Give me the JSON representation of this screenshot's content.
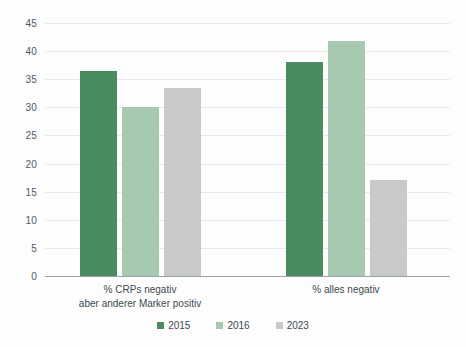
{
  "chart_data": {
    "type": "bar",
    "title": "",
    "subtitle": "",
    "xlabel": "",
    "ylabel": "",
    "ylim": [
      0,
      45
    ],
    "yticks": [
      0,
      5,
      10,
      15,
      20,
      25,
      30,
      35,
      40,
      45
    ],
    "ytick_labels": [
      "0",
      "5",
      "10",
      "15",
      "20",
      "25",
      "30",
      "35",
      "40",
      "45"
    ],
    "grid": true,
    "legend_position": "bottom",
    "categories": [
      "% CRPs negativ\naber anderer Marker positiv",
      "% alles negativ"
    ],
    "category_labels": [
      {
        "line1": "% CRPs negativ",
        "line2": "aber anderer Marker positiv"
      },
      {
        "line1": "% alles negativ",
        "line2": ""
      }
    ],
    "series": [
      {
        "name": "2015",
        "color": "#4a8b61",
        "values": [
          36.5,
          38.0
        ]
      },
      {
        "name": "2016",
        "color": "#a6c9af",
        "values": [
          30.0,
          41.8
        ]
      },
      {
        "name": "2023",
        "color": "#c8c9c9",
        "values": [
          33.5,
          17.0
        ]
      }
    ]
  },
  "legend": {
    "items": [
      {
        "label": "2015",
        "color": "#4a8b61"
      },
      {
        "label": "2016",
        "color": "#a6c9af"
      },
      {
        "label": "2023",
        "color": "#c8c9c9"
      }
    ]
  },
  "colors": {
    "series_2015": "#4a8b61",
    "series_2016": "#a6c9af",
    "series_2023": "#c8c9c9",
    "gridline": "#e4e9ec",
    "axis": "#9aa3a8",
    "text": "#3d4a52",
    "background": "#fdfdfd"
  }
}
